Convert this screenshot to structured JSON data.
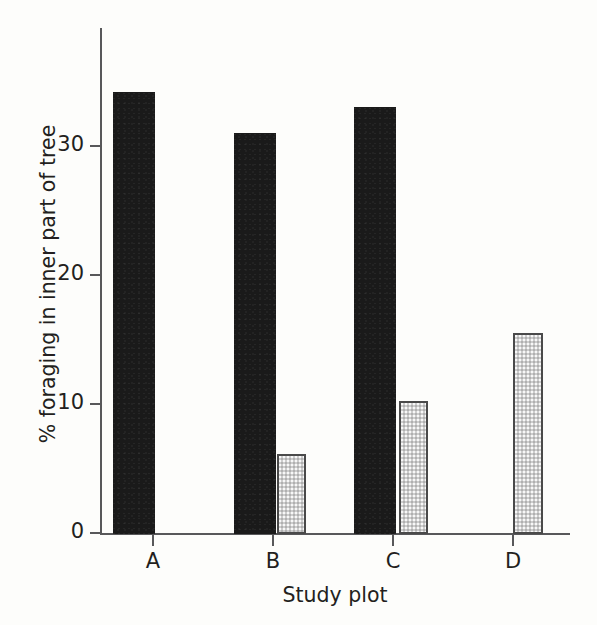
{
  "chart_data": {
    "type": "bar",
    "title": "",
    "xlabel": "Study plot",
    "ylabel": "% foraging in inner part of tree",
    "categories": [
      "A",
      "B",
      "C",
      "D"
    ],
    "series": [
      {
        "name": "dark",
        "color": "#1a1a1a",
        "values": [
          34.1,
          31.0,
          33.0,
          0
        ]
      },
      {
        "name": "light",
        "color": "#cdcdcd",
        "values": [
          0,
          6.2,
          10.3,
          15.5
        ]
      }
    ],
    "ytick_labels": [
      "0",
      "10",
      "20",
      "30"
    ],
    "ytick_values": [
      0,
      10,
      20,
      30
    ],
    "ylim": [
      0,
      39
    ],
    "grid": false,
    "legend": "none"
  },
  "axes": {
    "y_title": "% foraging in inner part of tree",
    "x_title": "Study plot"
  },
  "yticks": [
    {
      "label": "30",
      "value": 30
    },
    {
      "label": "20",
      "value": 20
    },
    {
      "label": "10",
      "value": 10
    },
    {
      "label": "0",
      "value": 0
    }
  ],
  "xticks": [
    {
      "label": "A"
    },
    {
      "label": "B"
    },
    {
      "label": "C"
    },
    {
      "label": "D"
    }
  ]
}
